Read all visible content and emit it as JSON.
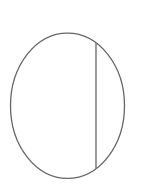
{
  "diagram": {
    "background": "#ffffff",
    "stroke_color": "#666666",
    "stroke_width": 1.3,
    "ellipse": {
      "cx": 67.5,
      "cy": 105.8,
      "rx": 57,
      "ry": 72.6
    },
    "chord": {
      "x1": 96,
      "y1": 42.8,
      "x2": 96,
      "y2": 168.6
    }
  }
}
